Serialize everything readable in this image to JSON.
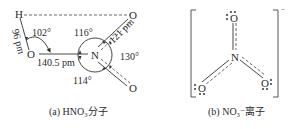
{
  "panel_a": {
    "caption": "(a) HNO₃分子",
    "atoms": {
      "H": "H",
      "O_hydroxyl": "O",
      "N": "N",
      "O_top": "O",
      "O_bottom": "O"
    },
    "labels": {
      "oh_bond": "96 pm",
      "hon_angle": "102°",
      "on_bond": "140.5 pm",
      "angle_top": "116°",
      "no_bond": "121 pm",
      "angle_right": "130°",
      "angle_bottom": "114°"
    }
  },
  "panel_b": {
    "caption": "(b) NO₃⁻离子",
    "charge": "−",
    "atoms": {
      "N": "N",
      "O_top": "O",
      "O_left": "O",
      "O_right": "O"
    }
  }
}
